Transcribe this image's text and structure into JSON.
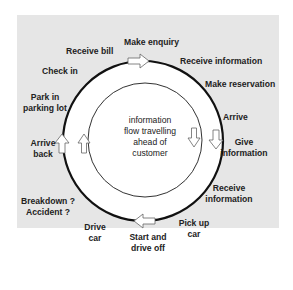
{
  "diagram": {
    "center_text": "information\nflow travelling\nahead of\ncustomer",
    "labels": {
      "make_enquiry": "Make enquiry",
      "receive_bill": "Receive bill",
      "receive_information_top": "Receive information",
      "check_in": "Check in",
      "make_reservation": "Make reservation",
      "park_in_parking_lot": "Park in\nparking lot",
      "arrive": "Arrive",
      "arrive_back": "Arrive\nback",
      "give_information": "Give\ninformation",
      "receive_information_bottom": "Receive\ninformation",
      "breakdown_accident": "Breakdown ?\nAccident ?",
      "drive_car": "Drive\ncar",
      "pick_up_car": "Pick up\ncar",
      "start_and_drive_off": "Start and\ndrive off"
    },
    "colors": {
      "background_panel": "#e6e6e6",
      "ring_fill": "#ffffff",
      "outer_line": "#111111",
      "inner_line": "#333333",
      "arrow_fill": "#ffffff",
      "arrow_stroke": "#666666"
    }
  }
}
